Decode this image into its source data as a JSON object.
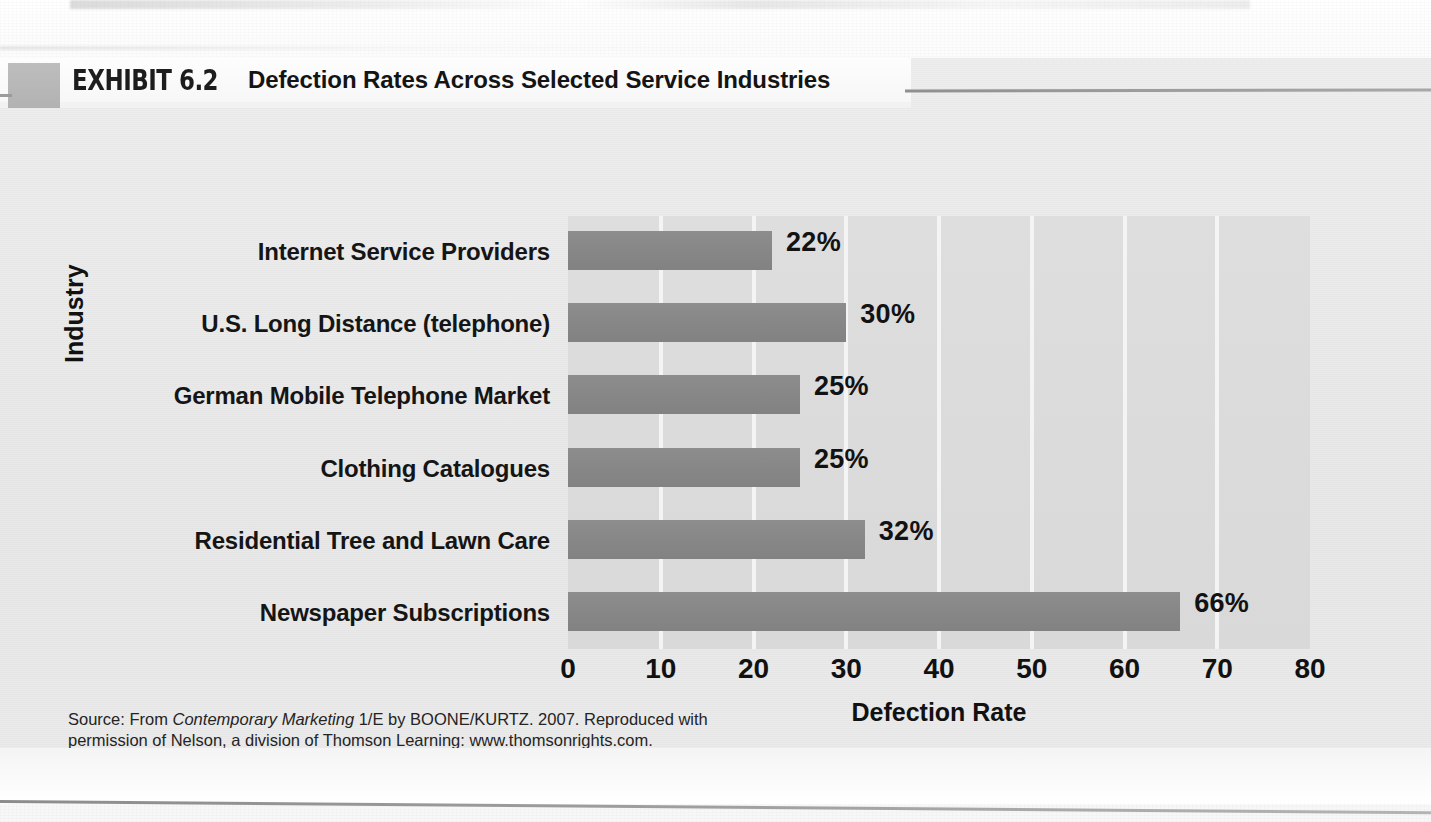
{
  "exhibit": {
    "label": "EXHIBIT 6.2",
    "title": "Defection Rates Across Selected Service Industries"
  },
  "source": {
    "line1_a": "Source: From ",
    "line1_italic": "Contemporary Marketing",
    "line1_b": " 1/E by BOONE/KURTZ. 2007. Reproduced with",
    "line2": "permission of Nelson, a division of Thomson Learning: www.thomsonrights.com.",
    "line3": "Fax 800 730-2215."
  },
  "colors": {
    "bar": "#878787",
    "plot_background": "#dbdbdb",
    "gridline": "#f4f4f4",
    "exhibit_background": "#e9e9e9",
    "text": "#121212"
  },
  "chart_data": {
    "type": "bar",
    "orientation": "horizontal",
    "title": "Defection Rates Across Selected Service Industries",
    "xlabel": "Defection Rate",
    "ylabel": "Industry",
    "xlim": [
      0,
      80
    ],
    "xticks": [
      0,
      10,
      20,
      30,
      40,
      50,
      60,
      70,
      80
    ],
    "xtick_labels": [
      "0",
      "10",
      "20",
      "30",
      "40",
      "50",
      "60",
      "70",
      "80"
    ],
    "grid": true,
    "legend": "none",
    "categories": [
      "Internet Service Providers",
      "U.S. Long Distance (telephone)",
      "German Mobile Telephone Market",
      "Clothing Catalogues",
      "Residential Tree and Lawn Care",
      "Newspaper Subscriptions"
    ],
    "values": [
      22,
      30,
      25,
      25,
      32,
      66
    ],
    "data_labels": [
      "22%",
      "30%",
      "25%",
      "25%",
      "32%",
      "66%"
    ]
  }
}
